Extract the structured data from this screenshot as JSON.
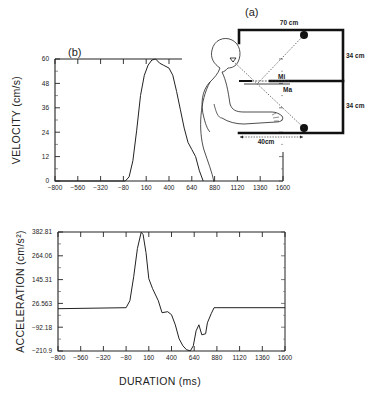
{
  "figure": {
    "panel_a_label": "(a)",
    "panel_b_label": "(b)",
    "xlabel": "DURATION (ms)"
  },
  "apparatus": {
    "top_width": "70 cm",
    "upper_height": "34 cm",
    "lower_height": "34 cm",
    "reach_distance": "40cm",
    "mirror_label_1": "Mi",
    "mirror_label_2": "Ma"
  },
  "chart_data": [
    {
      "type": "line",
      "title": "",
      "panel": "(b)",
      "xlabel": "",
      "ylabel": "VELOCITY (cm/s)",
      "xlim": [
        -800,
        1600
      ],
      "ylim": [
        0,
        60
      ],
      "x_ticks": [
        "-800",
        "-560",
        "-320",
        "-80",
        "160",
        "400",
        "640",
        "880",
        "1120",
        "1360",
        "1600"
      ],
      "y_ticks": [
        "0",
        "12",
        "24",
        "36",
        "48",
        "60"
      ],
      "grid": false,
      "series": [
        {
          "name": "velocity",
          "x": [
            -800,
            -60,
            -20,
            20,
            60,
            100,
            140,
            180,
            220,
            260,
            300,
            340,
            400,
            440,
            480,
            520,
            560,
            600,
            640,
            680,
            720,
            760
          ],
          "y": [
            0,
            0,
            2,
            10,
            25,
            42,
            52,
            57,
            59.5,
            60,
            58,
            57,
            55.5,
            52,
            44,
            35,
            26,
            19,
            15.5,
            12,
            5,
            0
          ]
        }
      ]
    },
    {
      "type": "line",
      "title": "",
      "xlabel": "DURATION (ms)",
      "ylabel": "ACCELERATION (cm/s²)",
      "xlim": [
        -800,
        1600
      ],
      "ylim": [
        -210.9,
        382.81
      ],
      "x_ticks": [
        "-800",
        "-560",
        "-320",
        "-80",
        "160",
        "400",
        "640",
        "880",
        "1120",
        "1360",
        "1600"
      ],
      "y_ticks": [
        "-210.9",
        "-92.18",
        "26.563",
        "145.31",
        "264.06",
        "382.81"
      ],
      "grid": false,
      "series": [
        {
          "name": "acceleration",
          "x": [
            -800,
            -80,
            -40,
            0,
            40,
            80,
            100,
            130,
            160,
            200,
            260,
            300,
            360,
            400,
            440,
            480,
            520,
            560,
            600,
            630,
            660,
            690,
            720,
            760,
            780,
            820,
            850,
            880,
            1600
          ],
          "y": [
            0,
            5,
            40,
            160,
            300,
            382,
            370,
            280,
            150,
            100,
            40,
            -20,
            -15,
            -30,
            -80,
            -150,
            -185,
            -205,
            -210,
            -185,
            -110,
            -80,
            -130,
            -125,
            -70,
            -25,
            5,
            5,
            5
          ]
        }
      ]
    }
  ]
}
